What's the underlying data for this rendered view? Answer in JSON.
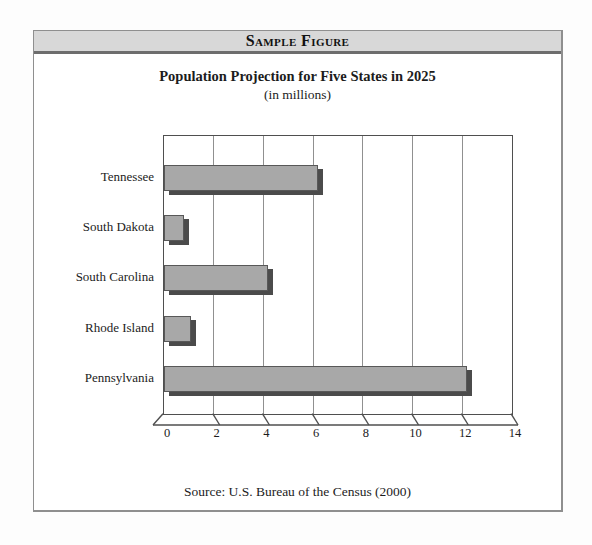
{
  "figure": {
    "header": {
      "label": "Sample Figure",
      "bg": "#d8d8d8"
    },
    "title": "Population Projection for Five States in 2025",
    "subtitle": "(in millions)",
    "source": "Source: U.S. Bureau of the Census (2000)"
  },
  "chart_data": {
    "type": "bar",
    "orientation": "horizontal",
    "title": "Population Projection for Five States in 2025",
    "subtitle": "(in millions)",
    "categories": [
      "Tennessee",
      "South Dakota",
      "South Carolina",
      "Rhode Island",
      "Pennsylvania"
    ],
    "values": [
      6.2,
      0.8,
      4.2,
      1.1,
      12.2
    ],
    "xlim": [
      0,
      14
    ],
    "xticks": [
      0,
      2,
      4,
      6,
      8,
      10,
      12,
      14
    ],
    "grid": "vertical gridlines at every tick",
    "legend": "none",
    "axis_style": "3d skewed base strip with slanted ticks",
    "bar_color": "#a8a8a8",
    "bar_shadow_color": "#4b4b4b",
    "gridline_color": "#909090",
    "plot_border_color": "#4f4f4f",
    "source": "Source: U.S. Bureau of the Census (2000)"
  },
  "colors": {
    "header_bg": "#d8d8d8",
    "header_rule": "#6d6d6d",
    "panel_border": "#8f8f8f",
    "text": "#1c1c1c",
    "page_bg": "#fdfdfd"
  }
}
